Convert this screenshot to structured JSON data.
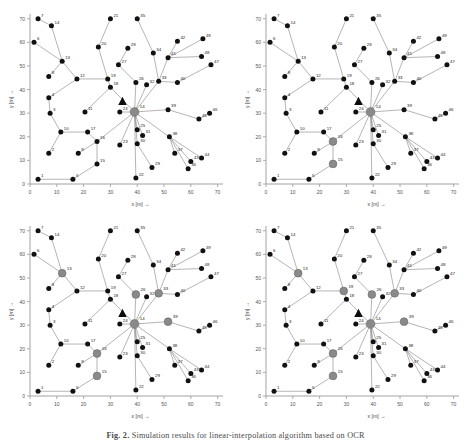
{
  "figure": {
    "caption_prefix": "Fig. 2.",
    "caption_text": "Simulation results for linear-interpolation algorithm based on OCR"
  },
  "axes": {
    "xlabel": "x [m] →",
    "ylabel": "y [m] →",
    "xticks": [
      0,
      10,
      20,
      30,
      40,
      50,
      60,
      70
    ],
    "yticks": [
      0,
      10,
      20,
      30,
      40,
      50,
      60,
      70
    ],
    "xlim": [
      0,
      72
    ],
    "ylim": [
      0,
      72
    ]
  },
  "legend_markers": {
    "normal_node": "black-filled-circle",
    "selected_node": "gray-filled-circle",
    "sink_marker": "black-triangle"
  },
  "colors": {
    "node_black": "#111111",
    "node_gray": "#8a8a8a",
    "edge": "#777777",
    "axis": "#999999",
    "label": "#222222",
    "background": "#ffffff"
  },
  "chart_data": {
    "type": "scatter",
    "title": "",
    "xlabel": "x [m] →",
    "ylabel": "y [m] →",
    "xlim": [
      0,
      72
    ],
    "ylim": [
      0,
      72
    ],
    "grid": false,
    "legend": "none",
    "triangle_marker": {
      "x": 34.5,
      "y": 35.0,
      "label": ""
    },
    "nodes": [
      {
        "id": 1,
        "x": 3.0,
        "y": 2.0
      },
      {
        "id": 2,
        "x": 7.0,
        "y": 13.0
      },
      {
        "id": 3,
        "x": 7.5,
        "y": 30.0
      },
      {
        "id": 4,
        "x": 7.0,
        "y": 36.5
      },
      {
        "id": 5,
        "x": 16.0,
        "y": 2.0
      },
      {
        "id": 6,
        "x": 1.5,
        "y": 60.0
      },
      {
        "id": 7,
        "x": 3.0,
        "y": 70.0
      },
      {
        "id": 8,
        "x": 7.0,
        "y": 45.5
      },
      {
        "id": 9,
        "x": 18.0,
        "y": 13.0
      },
      {
        "id": 10,
        "x": 11.5,
        "y": 22.0
      },
      {
        "id": 11,
        "x": 20.5,
        "y": 30.5
      },
      {
        "id": 12,
        "x": 17.5,
        "y": 44.5
      },
      {
        "id": 13,
        "x": 12.0,
        "y": 52.0
      },
      {
        "id": 14,
        "x": 8.0,
        "y": 67.0
      },
      {
        "id": 15,
        "x": 25.0,
        "y": 8.5
      },
      {
        "id": 16,
        "x": 25.0,
        "y": 18.0
      },
      {
        "id": 17,
        "x": 21.5,
        "y": 22.0
      },
      {
        "id": 18,
        "x": 30.0,
        "y": 41.0
      },
      {
        "id": 19,
        "x": 29.0,
        "y": 44.5
      },
      {
        "id": 20,
        "x": 25.5,
        "y": 58.0
      },
      {
        "id": 21,
        "x": 30.0,
        "y": 70.0
      },
      {
        "id": 22,
        "x": 39.5,
        "y": 2.5
      },
      {
        "id": 23,
        "x": 33.5,
        "y": 16.5
      },
      {
        "id": 24,
        "x": 33.5,
        "y": 30.5
      },
      {
        "id": 25,
        "x": 40.0,
        "y": 23.0
      },
      {
        "id": 26,
        "x": 39.5,
        "y": 43.0
      },
      {
        "id": 27,
        "x": 33.0,
        "y": 50.5
      },
      {
        "id": 28,
        "x": 36.5,
        "y": 57.5
      },
      {
        "id": 29,
        "x": 45.5,
        "y": 7.0
      },
      {
        "id": 30,
        "x": 40.0,
        "y": 17.0
      },
      {
        "id": 31,
        "x": 42.0,
        "y": 20.5
      },
      {
        "id": 32,
        "x": 43.5,
        "y": 42.0
      },
      {
        "id": 33,
        "x": 48.0,
        "y": 43.5
      },
      {
        "id": 34,
        "x": 46.0,
        "y": 55.5
      },
      {
        "id": 35,
        "x": 40.0,
        "y": 70.0
      },
      {
        "id": 36,
        "x": 59.0,
        "y": 6.5
      },
      {
        "id": 37,
        "x": 54.0,
        "y": 13.0
      },
      {
        "id": 38,
        "x": 52.0,
        "y": 20.0
      },
      {
        "id": 39,
        "x": 51.5,
        "y": 31.5
      },
      {
        "id": 40,
        "x": 55.0,
        "y": 43.0
      },
      {
        "id": 41,
        "x": 51.5,
        "y": 53.5
      },
      {
        "id": 42,
        "x": 55.0,
        "y": 60.5
      },
      {
        "id": 43,
        "x": 60.0,
        "y": 9.5
      },
      {
        "id": 44,
        "x": 64.0,
        "y": 11.0
      },
      {
        "id": 45,
        "x": 63.0,
        "y": 27.5
      },
      {
        "id": 46,
        "x": 67.0,
        "y": 30.0
      },
      {
        "id": 47,
        "x": 67.5,
        "y": 50.5
      },
      {
        "id": 48,
        "x": 64.0,
        "y": 54.0
      },
      {
        "id": 49,
        "x": 64.5,
        "y": 61.5
      },
      {
        "id": 50,
        "x": 39.0,
        "y": 30.5
      }
    ],
    "edges": [
      [
        1,
        5
      ],
      [
        5,
        15
      ],
      [
        15,
        16
      ],
      [
        16,
        17
      ],
      [
        16,
        9
      ],
      [
        17,
        10
      ],
      [
        10,
        2
      ],
      [
        10,
        3
      ],
      [
        3,
        4
      ],
      [
        4,
        12
      ],
      [
        12,
        13
      ],
      [
        13,
        8
      ],
      [
        13,
        14
      ],
      [
        13,
        6
      ],
      [
        14,
        7
      ],
      [
        12,
        19
      ],
      [
        19,
        20
      ],
      [
        20,
        21
      ],
      [
        19,
        18
      ],
      [
        18,
        11
      ],
      [
        18,
        50
      ],
      [
        24,
        50
      ],
      [
        23,
        50
      ],
      [
        22,
        50
      ],
      [
        30,
        50
      ],
      [
        29,
        30
      ],
      [
        25,
        50
      ],
      [
        31,
        50
      ],
      [
        26,
        50
      ],
      [
        26,
        27
      ],
      [
        27,
        28
      ],
      [
        32,
        50
      ],
      [
        33,
        50
      ],
      [
        33,
        34
      ],
      [
        34,
        35
      ],
      [
        33,
        41
      ],
      [
        41,
        42
      ],
      [
        41,
        49
      ],
      [
        41,
        48
      ],
      [
        33,
        40
      ],
      [
        40,
        47
      ],
      [
        39,
        50
      ],
      [
        39,
        45
      ],
      [
        45,
        46
      ],
      [
        38,
        50
      ],
      [
        38,
        37
      ],
      [
        38,
        43
      ],
      [
        38,
        44
      ],
      [
        38,
        36
      ],
      [
        16,
        50
      ]
    ],
    "panels": [
      {
        "index": 0,
        "position": "top-left",
        "selected_nodes": [
          50
        ],
        "description": "initial state, only sink hub selected"
      },
      {
        "index": 1,
        "position": "top-right",
        "selected_nodes": [
          50,
          16,
          15
        ],
        "description": "two additional cluster heads activated"
      },
      {
        "index": 2,
        "position": "bottom-left",
        "selected_nodes": [
          50,
          16,
          15,
          13,
          26,
          33,
          39
        ],
        "description": "further cluster heads activated"
      },
      {
        "index": 3,
        "position": "bottom-right",
        "selected_nodes": [
          50,
          16,
          15,
          13,
          19,
          26,
          33,
          39
        ],
        "description": "final state with full cluster head set"
      }
    ]
  }
}
